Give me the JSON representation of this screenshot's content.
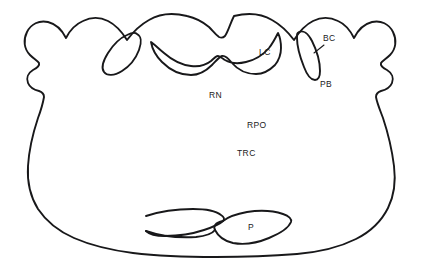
{
  "figure": {
    "name": "brainstem-cross-section-diagram",
    "type": "line-drawing",
    "background_color": "#ffffff",
    "stroke_color": "#18181a",
    "labels": [
      {
        "id": "lc",
        "text": "LC",
        "x": 259,
        "y": 52,
        "desc": "locus coeruleus"
      },
      {
        "id": "bc",
        "text": "BC",
        "x": 325,
        "y": 38,
        "desc": "brachium conjunctivum"
      },
      {
        "id": "pb",
        "text": "PB",
        "x": 322,
        "y": 84,
        "desc": "parabrachial nucleus"
      },
      {
        "id": "rn",
        "text": "RN",
        "x": 210,
        "y": 95,
        "desc": "raphe nucleus"
      },
      {
        "id": "rpo",
        "text": "RPO",
        "x": 248,
        "y": 125,
        "desc": "nucleus reticularis pontis oralis"
      },
      {
        "id": "trc",
        "text": "TRC",
        "x": 238,
        "y": 153,
        "desc": "tegmental reticular complex"
      },
      {
        "id": "p",
        "text": "P",
        "x": 249,
        "y": 227,
        "desc": "pons"
      }
    ]
  }
}
